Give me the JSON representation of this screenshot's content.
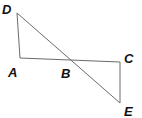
{
  "diagram": {
    "type": "geometry",
    "points": {
      "D": {
        "label": "D",
        "x": 17,
        "y": 13,
        "lx": 2,
        "ly": 14
      },
      "A": {
        "label": "A",
        "x": 20,
        "y": 58,
        "lx": 8,
        "ly": 77
      },
      "B": {
        "label": "B",
        "x": 71,
        "y": 61,
        "lx": 61,
        "ly": 78
      },
      "C": {
        "label": "C",
        "x": 120,
        "y": 62,
        "lx": 124,
        "ly": 63
      },
      "E": {
        "label": "E",
        "x": 120,
        "y": 103,
        "lx": 124,
        "ly": 116
      }
    },
    "segments": [
      {
        "from": "D",
        "to": "A"
      },
      {
        "from": "A",
        "to": "C"
      },
      {
        "from": "C",
        "to": "E"
      },
      {
        "from": "D",
        "to": "E"
      }
    ],
    "line_color": "#6b6b6b",
    "label_color": "#111111"
  }
}
